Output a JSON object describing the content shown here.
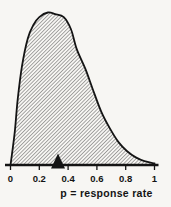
{
  "chart_data": {
    "type": "area",
    "title": "",
    "xlabel": "p = response rate",
    "ylabel": "",
    "xlim": [
      0,
      1
    ],
    "grid": false,
    "x_ticks": [
      {
        "value": 0,
        "label": "0"
      },
      {
        "value": 0.2,
        "label": "0.2"
      },
      {
        "value": 0.4,
        "label": "0.4"
      },
      {
        "value": 0.6,
        "label": "0.6"
      },
      {
        "value": 0.8,
        "label": "0.8"
      },
      {
        "value": 1,
        "label": "1"
      }
    ],
    "curve": {
      "description": "right-skewed density of response rate p, mode near p=0.26, area under curve filled with diagonal hatching",
      "p": [
        0,
        0.01,
        0.03,
        0.05,
        0.08,
        0.12,
        0.16,
        0.2,
        0.26,
        0.31,
        0.37,
        0.42,
        0.46,
        0.52,
        0.57,
        0.63,
        0.69,
        0.75,
        0.81,
        0.87,
        0.93,
        1.0
      ],
      "density_rel": [
        0,
        0.07,
        0.22,
        0.43,
        0.65,
        0.83,
        0.92,
        0.97,
        1.0,
        0.99,
        0.97,
        0.89,
        0.76,
        0.63,
        0.5,
        0.35,
        0.24,
        0.15,
        0.09,
        0.05,
        0.025,
        0.01
      ]
    },
    "marker": {
      "shape": "triangle-up",
      "p": 0.33
    },
    "fill_style": "diagonal-hatch",
    "colors": {
      "line": "#141414",
      "hatch": "#2e2e2e",
      "axis": "#141414",
      "text": "#141414",
      "background": "#f7f6f3"
    }
  }
}
